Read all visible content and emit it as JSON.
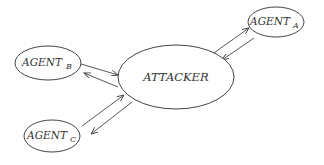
{
  "diagram": {
    "type": "network",
    "colors": {
      "stroke": "#444444",
      "text": "#333333",
      "background": "#ffffff"
    },
    "nodes": [
      {
        "id": "attacker",
        "label": "ATTACKER",
        "subscript": ""
      },
      {
        "id": "agent_a",
        "label": "AGENT",
        "subscript": "A"
      },
      {
        "id": "agent_b",
        "label": "AGENT",
        "subscript": "B"
      },
      {
        "id": "agent_c",
        "label": "AGENT",
        "subscript": "C"
      }
    ],
    "edges": [
      {
        "from": "attacker",
        "to": "agent_a"
      },
      {
        "from": "agent_a",
        "to": "attacker"
      },
      {
        "from": "agent_b",
        "to": "attacker"
      },
      {
        "from": "attacker",
        "to": "agent_b"
      },
      {
        "from": "agent_c",
        "to": "attacker"
      },
      {
        "from": "attacker",
        "to": "agent_c"
      }
    ]
  }
}
